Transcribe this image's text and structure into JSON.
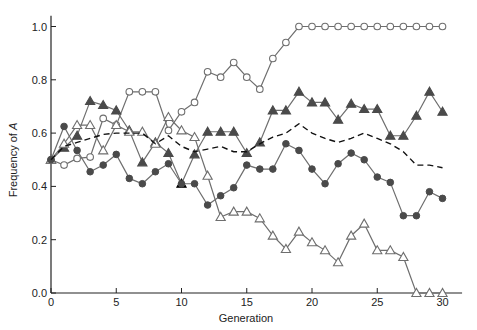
{
  "chart_data": {
    "type": "line",
    "title": "",
    "xlabel": "Generation",
    "ylabel": "Frequency of A",
    "xlim": [
      0,
      31
    ],
    "ylim": [
      0,
      1.05
    ],
    "xticks": [
      0,
      5,
      10,
      15,
      20,
      25,
      30
    ],
    "yticks": [
      "0.0",
      "0.2",
      "0.4",
      "0.6",
      "0.8",
      "1.0"
    ],
    "grid": false,
    "legend": "none",
    "x": [
      0,
      1,
      2,
      3,
      4,
      5,
      6,
      7,
      8,
      9,
      10,
      11,
      12,
      13,
      14,
      15,
      16,
      17,
      18,
      19,
      20,
      21,
      22,
      23,
      24,
      25,
      26,
      27,
      28,
      29,
      30
    ],
    "series": [
      {
        "name": "Population 1 (open circles)",
        "marker": "open-circle",
        "values": [
          0.5,
          0.48,
          0.505,
          0.51,
          0.655,
          0.63,
          0.755,
          0.755,
          0.755,
          0.61,
          0.68,
          0.715,
          0.83,
          0.81,
          0.865,
          0.81,
          0.765,
          0.88,
          0.94,
          1.0,
          1.0,
          1.0,
          1.0,
          1.0,
          1.0,
          1.0,
          1.0,
          1.0,
          1.0,
          1.0,
          1.0
        ]
      },
      {
        "name": "Population 2 (filled triangles)",
        "marker": "filled-triangle",
        "values": [
          0.5,
          0.545,
          0.59,
          0.72,
          0.705,
          0.685,
          0.61,
          0.49,
          0.565,
          0.525,
          0.41,
          0.52,
          0.605,
          0.605,
          0.605,
          0.525,
          0.565,
          0.685,
          0.685,
          0.755,
          0.715,
          0.715,
          0.65,
          0.71,
          0.69,
          0.69,
          0.59,
          0.59,
          0.665,
          0.755,
          0.68
        ]
      },
      {
        "name": "Population 3 (open triangles)",
        "marker": "open-triangle",
        "values": [
          0.5,
          0.56,
          0.63,
          0.63,
          0.535,
          0.63,
          0.605,
          0.605,
          0.56,
          0.66,
          0.61,
          0.585,
          0.44,
          0.285,
          0.305,
          0.305,
          0.28,
          0.215,
          0.165,
          0.23,
          0.19,
          0.16,
          0.115,
          0.215,
          0.26,
          0.16,
          0.16,
          0.135,
          0.0,
          0.0,
          0.0
        ]
      },
      {
        "name": "Population 4 (filled circles)",
        "marker": "filled-circle",
        "values": [
          0.5,
          0.625,
          0.535,
          0.455,
          0.48,
          0.52,
          0.43,
          0.41,
          0.455,
          0.485,
          0.41,
          0.41,
          0.33,
          0.365,
          0.395,
          0.48,
          0.465,
          0.465,
          0.56,
          0.535,
          0.465,
          0.41,
          0.485,
          0.525,
          0.5,
          0.435,
          0.415,
          0.29,
          0.29,
          0.38,
          0.355
        ]
      },
      {
        "name": "Mean (dashed)",
        "marker": "none",
        "dashed": true,
        "values": [
          0.5,
          0.55,
          0.565,
          0.58,
          0.595,
          0.6,
          0.6,
          0.6,
          0.56,
          0.59,
          0.55,
          0.53,
          0.54,
          0.55,
          0.53,
          0.53,
          0.56,
          0.585,
          0.6,
          0.635,
          0.6,
          0.58,
          0.565,
          0.58,
          0.6,
          0.58,
          0.56,
          0.53,
          0.48,
          0.48,
          0.47
        ]
      }
    ],
    "colors": {
      "line": "#6e6e6e",
      "marker_fill": "#4a4a4a",
      "axis": "#222222",
      "dashed": "#111111"
    }
  }
}
